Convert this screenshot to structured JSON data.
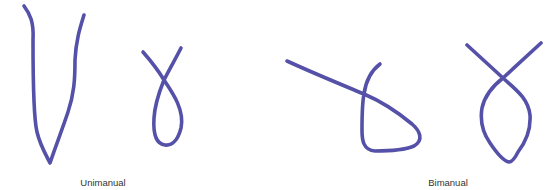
{
  "figure": {
    "stroke_color": "#5550a8",
    "stroke_width": 3.6,
    "groups": [
      {
        "label": "Unimanual",
        "traces": [
          {
            "name": "v-shape-trace",
            "path": "M24,6 C30,14 34,22 33,40 C33,80 34,120 37,132 C40,145 46,155 50,163 C55,148 62,130 68,112 C74,94 75,80 75,60 C76,40 80,28 84,15"
          },
          {
            "name": "small-loop-trace",
            "path": "M143,52 C150,60 158,70 164,80 C172,92 185,110 181,128 C178,140 172,146 165,145 C156,144 153,134 154,118 C155,102 160,90 164,80 C170,68 176,58 181,48"
          }
        ]
      },
      {
        "label": "Bimanual",
        "traces": [
          {
            "name": "open-loop-trace",
            "path": "M287,61 C313,73 340,84 364,94 C385,103 400,114 412,124 C420,131 424,140 414,146 C402,151 386,151 375,151 C363,150 362,140 362,130 C362,116 362,104 364,94 C366,80 372,70 380,64"
          },
          {
            "name": "closed-loop-trace",
            "path": "M467,45 C480,57 492,68 503,78 C516,90 528,98 530,115 C531,130 525,143 518,152 C515,158 512,162 509,162 C503,161 496,152 490,143 C483,133 480,120 482,108 C485,94 494,85 503,78 C515,67 528,55 541,43"
          }
        ]
      }
    ]
  }
}
